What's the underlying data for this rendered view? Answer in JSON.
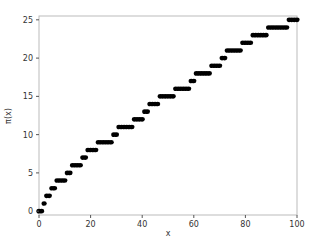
{
  "chart_data": {
    "type": "scatter",
    "title": "",
    "xlabel": "x",
    "ylabel": "π(x)",
    "xlim": [
      0,
      100
    ],
    "ylim": [
      -0.5,
      25.5
    ],
    "xticks": [
      0,
      20,
      40,
      60,
      80,
      100
    ],
    "yticks": [
      0,
      5,
      10,
      15,
      20,
      25
    ],
    "grid": false,
    "legend": null,
    "marker_color": "#000000",
    "x": [
      0,
      1,
      2,
      3,
      4,
      5,
      6,
      7,
      8,
      9,
      10,
      11,
      12,
      13,
      14,
      15,
      16,
      17,
      18,
      19,
      20,
      21,
      22,
      23,
      24,
      25,
      26,
      27,
      28,
      29,
      30,
      31,
      32,
      33,
      34,
      35,
      36,
      37,
      38,
      39,
      40,
      41,
      42,
      43,
      44,
      45,
      46,
      47,
      48,
      49,
      50,
      51,
      52,
      53,
      54,
      55,
      56,
      57,
      58,
      59,
      60,
      61,
      62,
      63,
      64,
      65,
      66,
      67,
      68,
      69,
      70,
      71,
      72,
      73,
      74,
      75,
      76,
      77,
      78,
      79,
      80,
      81,
      82,
      83,
      84,
      85,
      86,
      87,
      88,
      89,
      90,
      91,
      92,
      93,
      94,
      95,
      96,
      97,
      98,
      99,
      100
    ],
    "y": [
      0,
      0,
      1,
      2,
      2,
      3,
      3,
      4,
      4,
      4,
      4,
      5,
      5,
      6,
      6,
      6,
      6,
      7,
      7,
      8,
      8,
      8,
      8,
      9,
      9,
      9,
      9,
      9,
      9,
      10,
      10,
      11,
      11,
      11,
      11,
      11,
      11,
      12,
      12,
      12,
      12,
      13,
      13,
      14,
      14,
      14,
      14,
      15,
      15,
      15,
      15,
      15,
      15,
      16,
      16,
      16,
      16,
      16,
      16,
      17,
      17,
      18,
      18,
      18,
      18,
      18,
      18,
      19,
      19,
      19,
      19,
      20,
      20,
      21,
      21,
      21,
      21,
      21,
      21,
      22,
      22,
      22,
      22,
      23,
      23,
      23,
      23,
      23,
      23,
      24,
      24,
      24,
      24,
      24,
      24,
      24,
      24,
      25,
      25,
      25,
      25
    ]
  }
}
